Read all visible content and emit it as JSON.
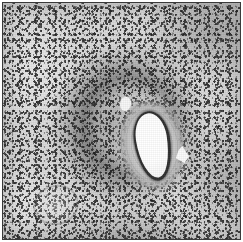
{
  "figure": {
    "kind": "histopathology-micrograph",
    "modality": "light microscopy",
    "stain_appearance": "grayscale hematoxylin-type nuclear stain",
    "width_px": 243,
    "height_px": 242,
    "caption": "",
    "has_visible_text": false,
    "border": {
      "present": true,
      "color": "#3a3a3a",
      "thickness_px": 1,
      "outer_margin_px": 2,
      "margin_color": "#ffffff"
    }
  },
  "palette": {
    "background_tissue": "#d9d9d9",
    "nuclei_dark": "#1d1d1d",
    "nuclei_mid": "#3a3a3a",
    "vessel_wall": "#d2d2d2",
    "endothelium": "#2e2e2e",
    "lumen_white": "#ffffff",
    "frame_line": "#3a3a3a",
    "page_white": "#ffffff"
  },
  "structures": [
    {
      "id": "vessel-lumen",
      "label": "Vessel lumen",
      "description": "Elongated empty white lumen of a blood vessel, oriented vertically and tilted slightly counter-clockwise",
      "center_px": [
        150,
        143
      ],
      "size_px": [
        31,
        65
      ],
      "rotation_deg": -9,
      "fill": "#ffffff"
    },
    {
      "id": "endothelial-lining",
      "label": "Endothelial lining",
      "description": "Thin dark rim of endothelial nuclei bounding the lumen",
      "center_px": [
        150,
        143
      ],
      "size_px": [
        36,
        70
      ],
      "fill": "#2e2e2e"
    },
    {
      "id": "vessel-wall",
      "label": "Vessel wall",
      "description": "Pale fibromuscular wall with concentric striations encircling the lumen",
      "center_px": [
        149,
        142
      ],
      "size_px": [
        66,
        92
      ],
      "rotation_deg": -9,
      "fill": "#d2d2d2"
    },
    {
      "id": "perivascular-cuff",
      "label": "Perivascular cell cuff",
      "description": "Dense dark ring of small round inflammatory-cell nuclei cuffing the vessel",
      "center_px": [
        126,
        122
      ],
      "size_px": [
        160,
        168
      ]
    },
    {
      "id": "clear-space-superior",
      "label": "Clear space, superior",
      "description": "Small rounded clear space just above and left of the vessel wall",
      "center_px": [
        122,
        101
      ],
      "size_px": [
        11,
        14
      ],
      "fill": "#f6f6f6"
    },
    {
      "id": "clear-space-lateral",
      "label": "Clear space, lateral",
      "description": "Small angular white artifact to the right of the vessel",
      "center_px": [
        179,
        151
      ],
      "size_px": [
        14,
        17
      ],
      "fill": "#fafafa"
    },
    {
      "id": "secondary-vessel-ring",
      "label": "Secondary vessel ring",
      "description": "Faint pale ring suggesting a second small vessel profile in the lower-left quadrant",
      "center_px": [
        51,
        200
      ],
      "size_px": [
        42,
        36
      ]
    },
    {
      "id": "tissue-field",
      "label": "Parenchymal tissue field",
      "description": "Dense stippled field of nuclei on a light grey background, denser toward the upper right and around the vessel, paler toward the left margin"
    }
  ]
}
